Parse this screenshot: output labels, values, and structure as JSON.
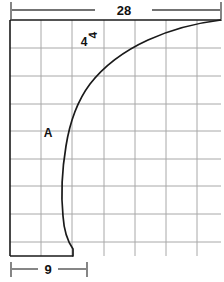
{
  "drawing": {
    "title": "Curved profile grid drawing",
    "background_color": "#ffffff",
    "outline_color": "#1a1a1a",
    "grid_color": "#a8a8a8",
    "dimension_color": "#444444",
    "labels": {
      "top_dimension": "28",
      "bottom_dimension": "9",
      "region_label": "A",
      "grid_label_upright": "4",
      "grid_label_rotated": "4"
    },
    "geometry": {
      "frame_left": 10,
      "frame_right": 221,
      "frame_top": 20,
      "frame_bottom": 256,
      "grid_columns_x": [
        10,
        41,
        72,
        104,
        135,
        166,
        197,
        221
      ],
      "grid_rows_y": [
        20,
        48,
        76,
        104,
        131,
        159,
        186,
        214,
        242,
        256
      ],
      "curve_points": [
        [
          221,
          20
        ],
        [
          190,
          26
        ],
        [
          160,
          35
        ],
        [
          132,
          48
        ],
        [
          110,
          62
        ],
        [
          92,
          80
        ],
        [
          78,
          101
        ],
        [
          69,
          124
        ],
        [
          64,
          150
        ],
        [
          62,
          180
        ],
        [
          63,
          210
        ],
        [
          66,
          232
        ],
        [
          73,
          247
        ],
        [
          73,
          256
        ]
      ],
      "top_dim_line_y": 10,
      "top_dim_segments": [
        [
          12,
          95
        ],
        [
          152,
          220
        ]
      ],
      "top_dim_tick_x": [
        11,
        221
      ],
      "bottom_dim_line_y": 269,
      "bottom_dim_segments": [
        [
          12,
          38
        ],
        [
          58,
          86
        ]
      ],
      "bottom_dim_tick_x": [
        11,
        87
      ]
    }
  }
}
